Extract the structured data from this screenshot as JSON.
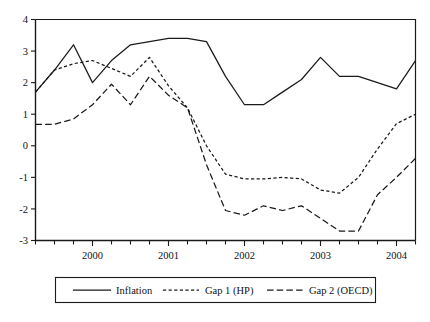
{
  "chart_data": {
    "type": "line",
    "title": "",
    "subtitle": "",
    "xlabel": "",
    "ylabel": "",
    "xlim": [
      1999.25,
      2004.25
    ],
    "ylim": [
      -3,
      4
    ],
    "grid": false,
    "legend_position": "bottom",
    "ytick_labels": [
      "4",
      "3",
      "2",
      "1",
      "0",
      "-1",
      "-2",
      "-3"
    ],
    "ytick_values": [
      4,
      3,
      2,
      1,
      0,
      -1,
      -2,
      -3
    ],
    "xtick_labels": [
      "2000",
      "2001",
      "2002",
      "2003",
      "2004"
    ],
    "xtick_values": [
      2000,
      2001,
      2002,
      2003,
      2004
    ],
    "minor_xticks_per_year": 4,
    "x": [
      1999.25,
      1999.5,
      1999.75,
      2000.0,
      2000.25,
      2000.5,
      2000.75,
      2001.0,
      2001.25,
      2001.5,
      2001.75,
      2002.0,
      2002.25,
      2002.5,
      2002.75,
      2003.0,
      2003.25,
      2003.5,
      2003.75,
      2004.0,
      2004.25
    ],
    "series": [
      {
        "name": "Inflation",
        "style": "solid",
        "color": "#1a1a1a",
        "values": [
          1.7,
          2.4,
          3.2,
          2.0,
          2.7,
          3.2,
          3.3,
          3.4,
          3.4,
          3.3,
          2.2,
          1.3,
          1.3,
          1.7,
          2.1,
          2.8,
          2.2,
          2.2,
          2.0,
          1.8,
          2.7
        ]
      },
      {
        "name": "Gap 1 (HP)",
        "style": "dashed-short",
        "color": "#1a1a1a",
        "values": [
          1.7,
          2.4,
          2.6,
          2.7,
          2.45,
          2.2,
          2.8,
          1.9,
          1.2,
          0.0,
          -0.9,
          -1.05,
          -1.05,
          -1.0,
          -1.05,
          -1.4,
          -1.5,
          -1.0,
          -0.1,
          0.7,
          1.0
        ]
      },
      {
        "name": "Gap 2 (OECD)",
        "style": "dashed-long",
        "color": "#1a1a1a",
        "values": [
          0.68,
          0.68,
          0.85,
          1.3,
          1.95,
          1.3,
          2.2,
          1.6,
          1.2,
          -0.6,
          -2.05,
          -2.2,
          -1.9,
          -2.05,
          -1.9,
          -2.3,
          -2.7,
          -2.7,
          -1.55,
          -1.0,
          -0.4
        ]
      }
    ]
  },
  "legend": {
    "entries": [
      {
        "label": "Inflation",
        "style": "solid"
      },
      {
        "label": "Gap 1 (HP)",
        "style": "dashed-short"
      },
      {
        "label": "Gap 2 (OECD)",
        "style": "dashed-long"
      }
    ]
  }
}
